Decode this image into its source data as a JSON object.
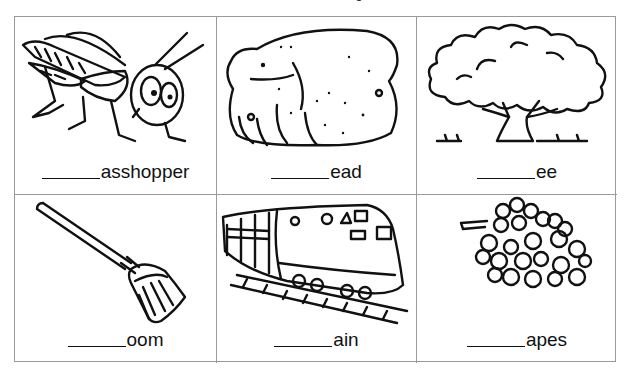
{
  "worksheet": {
    "title_fragment": "g",
    "blank": "______",
    "cells": [
      {
        "picture": "grasshopper-icon",
        "suffix": "asshopper"
      },
      {
        "picture": "bread-icon",
        "suffix": "ead"
      },
      {
        "picture": "tree-icon",
        "suffix": "ee"
      },
      {
        "picture": "broom-icon",
        "suffix": "oom"
      },
      {
        "picture": "train-icon",
        "suffix": "ain"
      },
      {
        "picture": "grapes-icon",
        "suffix": "apes"
      }
    ]
  },
  "colors": {
    "grid_border": "#9a9a9a",
    "ink": "#111111",
    "background": "#ffffff"
  }
}
